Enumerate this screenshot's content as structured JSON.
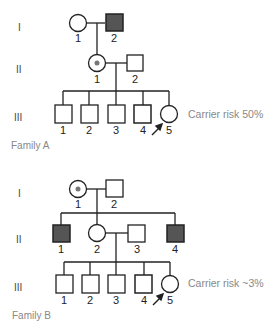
{
  "family_a": {
    "label": "Family A",
    "generations": [
      "I",
      "II",
      "III"
    ],
    "gen1": [
      {
        "id": "1",
        "sex": "female",
        "status": "unaffected"
      },
      {
        "id": "2",
        "sex": "male",
        "status": "affected"
      }
    ],
    "gen2": [
      {
        "id": "1",
        "sex": "female",
        "status": "carrier"
      },
      {
        "id": "2",
        "sex": "male",
        "status": "unaffected"
      }
    ],
    "gen3": [
      {
        "id": "1",
        "sex": "male",
        "status": "unaffected"
      },
      {
        "id": "2",
        "sex": "male",
        "status": "unaffected"
      },
      {
        "id": "3",
        "sex": "male",
        "status": "unaffected"
      },
      {
        "id": "4",
        "sex": "male",
        "status": "unaffected"
      },
      {
        "id": "5",
        "sex": "female",
        "status": "unaffected",
        "proband": true
      }
    ],
    "carrier_risk": "Carrier risk 50%"
  },
  "family_b": {
    "label": "Family B",
    "generations": [
      "I",
      "II",
      "III"
    ],
    "gen1": [
      {
        "id": "1",
        "sex": "female",
        "status": "carrier"
      },
      {
        "id": "2",
        "sex": "male",
        "status": "unaffected"
      }
    ],
    "gen2": [
      {
        "id": "1",
        "sex": "male",
        "status": "affected"
      },
      {
        "id": "2",
        "sex": "female",
        "status": "unaffected"
      },
      {
        "id": "3",
        "sex": "male",
        "status": "unaffected"
      },
      {
        "id": "4",
        "sex": "male",
        "status": "affected"
      }
    ],
    "gen3": [
      {
        "id": "1",
        "sex": "male",
        "status": "unaffected"
      },
      {
        "id": "2",
        "sex": "male",
        "status": "unaffected"
      },
      {
        "id": "3",
        "sex": "male",
        "status": "unaffected"
      },
      {
        "id": "4",
        "sex": "male",
        "status": "unaffected"
      },
      {
        "id": "5",
        "sex": "female",
        "status": "unaffected",
        "proband": true
      }
    ],
    "carrier_risk": "Carrier risk ~3%"
  },
  "colors": {
    "affected_fill": "#555555",
    "carrier_dot": "#777777",
    "line": "#222222",
    "annotation": "#888888"
  }
}
